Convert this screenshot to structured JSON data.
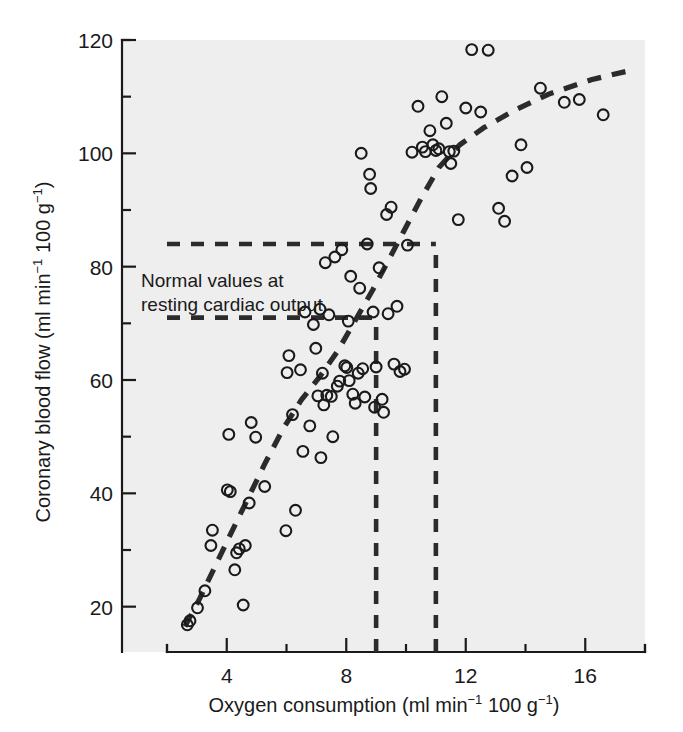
{
  "figure": {
    "background": "#ffffff",
    "plot_background": "#eeeeee",
    "ink_color": "#1a1a1a"
  },
  "chart_data": {
    "type": "scatter",
    "title": "",
    "xlabel": "Oxygen consumption (ml min−1 100 g−1)",
    "ylabel": "Coronary blood flow (ml min−1 100 g−1)",
    "xlabel_parts": {
      "main": "Oxygen consumption (ml min",
      "sup1": "−1",
      "mid": " 100 g",
      "sup2": "−1",
      "tail": ")"
    },
    "ylabel_parts": {
      "main": "Coronary blood flow (ml min",
      "sup1": "−1",
      "mid": " 100 g",
      "sup2": "−1",
      "tail": ")"
    },
    "xlim": [
      2,
      18
    ],
    "ylim": [
      12,
      120
    ],
    "x_major_ticks": [
      4,
      8,
      12,
      16
    ],
    "x_major_tick_labels": [
      "4",
      "8",
      "12",
      "16"
    ],
    "x_minor_ticks": [
      2,
      6,
      10,
      14,
      18
    ],
    "y_major_ticks": [
      20,
      40,
      60,
      80,
      100,
      120
    ],
    "y_major_tick_labels": [
      "20",
      "40",
      "60",
      "80",
      "100",
      "120"
    ],
    "y_minor_ticks": [
      30,
      50,
      70,
      90,
      110
    ],
    "grid": false,
    "legend": null,
    "annotations": [
      {
        "name": "normal-values-annotation",
        "line1": "Normal values at",
        "line2": "resting cardiac output",
        "x": 2.4,
        "y": 79
      }
    ],
    "guide_lines": [
      {
        "name": "upper-horizontal-guide",
        "orientation": "horizontal",
        "value": 84,
        "from": 2,
        "to": 11
      },
      {
        "name": "lower-horizontal-guide",
        "orientation": "horizontal",
        "value": 71,
        "from": 2,
        "to": 9
      },
      {
        "name": "left-vertical-guide",
        "orientation": "vertical",
        "value": 9,
        "from": 12,
        "to": 71
      },
      {
        "name": "right-vertical-guide",
        "orientation": "vertical",
        "value": 11,
        "from": 12,
        "to": 84
      }
    ],
    "trend_line": {
      "name": "fitted-trend-curve",
      "style": "dashed",
      "points": [
        [
          2.6,
          16.5
        ],
        [
          3.1,
          21.5
        ],
        [
          3.6,
          27.0
        ],
        [
          4.1,
          32.5
        ],
        [
          4.7,
          39.0
        ],
        [
          5.3,
          45.5
        ],
        [
          5.9,
          51.5
        ],
        [
          6.5,
          56.5
        ],
        [
          7.1,
          60.5
        ],
        [
          7.7,
          65.0
        ],
        [
          8.3,
          70.5
        ],
        [
          8.9,
          76.0
        ],
        [
          9.4,
          81.0
        ],
        [
          9.9,
          86.0
        ],
        [
          10.5,
          92.0
        ],
        [
          11.1,
          97.5
        ],
        [
          11.8,
          101.5
        ],
        [
          12.6,
          104.5
        ],
        [
          13.6,
          107.5
        ],
        [
          14.8,
          110.5
        ],
        [
          16.2,
          113.0
        ],
        [
          17.4,
          114.5
        ]
      ]
    },
    "series": [
      {
        "name": "Coronary blood flow vs oxygen consumption",
        "marker": "open-circle",
        "points": [
          [
            2.68,
            16.8
          ],
          [
            2.77,
            17.5
          ],
          [
            3.02,
            19.8
          ],
          [
            3.27,
            22.8
          ],
          [
            3.47,
            30.8
          ],
          [
            3.52,
            33.5
          ],
          [
            4.02,
            40.6
          ],
          [
            4.12,
            40.3
          ],
          [
            4.07,
            50.4
          ],
          [
            4.27,
            26.5
          ],
          [
            4.33,
            29.5
          ],
          [
            4.42,
            30.2
          ],
          [
            4.55,
            20.3
          ],
          [
            4.62,
            30.8
          ],
          [
            4.75,
            38.3
          ],
          [
            4.82,
            52.5
          ],
          [
            4.97,
            49.9
          ],
          [
            5.27,
            41.2
          ],
          [
            5.98,
            33.4
          ],
          [
            6.02,
            61.3
          ],
          [
            6.08,
            64.3
          ],
          [
            6.2,
            53.9
          ],
          [
            6.3,
            37.0
          ],
          [
            6.47,
            61.8
          ],
          [
            6.55,
            47.4
          ],
          [
            6.62,
            72.0
          ],
          [
            6.78,
            51.9
          ],
          [
            6.9,
            69.8
          ],
          [
            6.98,
            65.6
          ],
          [
            7.05,
            57.2
          ],
          [
            7.12,
            72.5
          ],
          [
            7.15,
            46.3
          ],
          [
            7.2,
            61.2
          ],
          [
            7.25,
            55.6
          ],
          [
            7.3,
            80.7
          ],
          [
            7.35,
            57.3
          ],
          [
            7.42,
            71.5
          ],
          [
            7.5,
            57.1
          ],
          [
            7.55,
            50.0
          ],
          [
            7.62,
            81.7
          ],
          [
            7.7,
            58.9
          ],
          [
            7.78,
            59.8
          ],
          [
            7.85,
            83.0
          ],
          [
            7.95,
            62.5
          ],
          [
            8.02,
            62.2
          ],
          [
            8.07,
            70.4
          ],
          [
            8.1,
            59.9
          ],
          [
            8.15,
            78.3
          ],
          [
            8.22,
            57.5
          ],
          [
            8.3,
            55.9
          ],
          [
            8.4,
            61.2
          ],
          [
            8.45,
            76.2
          ],
          [
            8.5,
            100.0
          ],
          [
            8.55,
            62.0
          ],
          [
            8.62,
            57.0
          ],
          [
            8.7,
            84.0
          ],
          [
            8.78,
            96.3
          ],
          [
            8.82,
            93.8
          ],
          [
            8.9,
            72.0
          ],
          [
            8.95,
            55.2
          ],
          [
            9.0,
            62.3
          ],
          [
            9.1,
            79.8
          ],
          [
            9.2,
            56.6
          ],
          [
            9.25,
            54.3
          ],
          [
            9.35,
            89.2
          ],
          [
            9.4,
            71.7
          ],
          [
            9.5,
            90.5
          ],
          [
            9.6,
            62.8
          ],
          [
            9.7,
            73.0
          ],
          [
            9.8,
            61.5
          ],
          [
            9.95,
            61.9
          ],
          [
            10.05,
            83.8
          ],
          [
            10.2,
            100.2
          ],
          [
            10.4,
            108.3
          ],
          [
            10.55,
            101.1
          ],
          [
            10.65,
            100.3
          ],
          [
            10.8,
            104.0
          ],
          [
            10.9,
            101.5
          ],
          [
            11.0,
            100.5
          ],
          [
            11.1,
            100.8
          ],
          [
            11.2,
            110.0
          ],
          [
            11.35,
            105.3
          ],
          [
            11.45,
            100.3
          ],
          [
            11.5,
            98.2
          ],
          [
            11.6,
            100.4
          ],
          [
            11.75,
            88.3
          ],
          [
            12.0,
            108.0
          ],
          [
            12.2,
            118.3
          ],
          [
            12.5,
            107.3
          ],
          [
            12.75,
            118.2
          ],
          [
            13.1,
            90.3
          ],
          [
            13.3,
            88.0
          ],
          [
            13.55,
            96.0
          ],
          [
            13.85,
            101.5
          ],
          [
            14.05,
            97.5
          ],
          [
            14.5,
            111.5
          ],
          [
            15.3,
            109.0
          ],
          [
            15.8,
            109.5
          ],
          [
            16.6,
            106.8
          ]
        ]
      }
    ]
  }
}
